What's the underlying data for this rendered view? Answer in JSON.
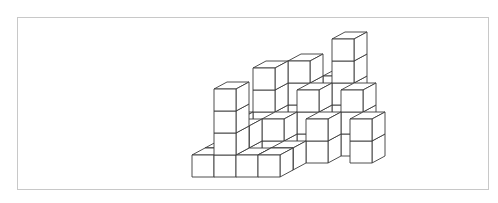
{
  "figure": {
    "type": "isometric-cube-stack",
    "colors": {
      "stroke": "#3a3a3a",
      "fill": "#ffffff",
      "frame_border": "#c8c8c8"
    },
    "projection": {
      "size": 22,
      "depth_dx": 13,
      "depth_dy": -7,
      "origin_x": 192,
      "origin_y": 177
    },
    "cubes": [
      {
        "x": 3,
        "y": 0,
        "z": 5
      },
      {
        "x": 3,
        "y": 1,
        "z": 5
      },
      {
        "x": 3,
        "y": 2,
        "z": 5
      },
      {
        "x": 2,
        "y": 0,
        "z": 4
      },
      {
        "x": 2,
        "y": 1,
        "z": 4
      },
      {
        "x": 2,
        "y": 2,
        "z": 4
      },
      {
        "x": 2,
        "y": 3,
        "z": 4
      },
      {
        "x": 4,
        "y": 0,
        "z": 4
      },
      {
        "x": 4,
        "y": 1,
        "z": 4
      },
      {
        "x": 4,
        "y": 2,
        "z": 4
      },
      {
        "x": 4,
        "y": 3,
        "z": 4
      },
      {
        "x": 4,
        "y": 4,
        "z": 4
      },
      {
        "x": 1,
        "y": 0,
        "z": 3
      },
      {
        "x": 1,
        "y": 1,
        "z": 3
      },
      {
        "x": 1,
        "y": 2,
        "z": 3
      },
      {
        "x": 1,
        "y": 3,
        "z": 3
      },
      {
        "x": 3,
        "y": 0,
        "z": 3
      },
      {
        "x": 3,
        "y": 1,
        "z": 3
      },
      {
        "x": 3,
        "y": 2,
        "z": 3
      },
      {
        "x": 5,
        "y": 0,
        "z": 3
      },
      {
        "x": 5,
        "y": 1,
        "z": 3
      },
      {
        "x": 5,
        "y": 2,
        "z": 3
      },
      {
        "x": 0,
        "y": 0,
        "z": 2
      },
      {
        "x": 0,
        "y": 1,
        "z": 2
      },
      {
        "x": 2,
        "y": 0,
        "z": 2
      },
      {
        "x": 2,
        "y": 1,
        "z": 2
      },
      {
        "x": 4,
        "y": 0,
        "z": 2
      },
      {
        "x": 4,
        "y": 1,
        "z": 2
      },
      {
        "x": 6,
        "y": 0,
        "z": 2
      },
      {
        "x": 6,
        "y": 1,
        "z": 2
      },
      {
        "x": 0,
        "y": 0,
        "z": 1
      },
      {
        "x": 1,
        "y": 0,
        "z": 1
      },
      {
        "x": 1,
        "y": 1,
        "z": 1
      },
      {
        "x": 3,
        "y": 0,
        "z": 1
      },
      {
        "x": 0,
        "y": 0,
        "z": 0
      },
      {
        "x": 1,
        "y": 0,
        "z": 0
      },
      {
        "x": 1,
        "y": 1,
        "z": 0
      },
      {
        "x": 1,
        "y": 2,
        "z": 0
      },
      {
        "x": 1,
        "y": 3,
        "z": 0
      },
      {
        "x": 2,
        "y": 0,
        "z": 0
      },
      {
        "x": 3,
        "y": 0,
        "z": 0
      }
    ]
  }
}
